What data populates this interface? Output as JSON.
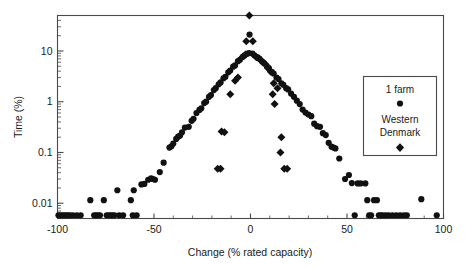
{
  "figure": {
    "background": "#ffffff",
    "frame_color": "#4a4a4a",
    "marker_color": "#111111"
  },
  "chart_data": {
    "type": "scatter",
    "title": "",
    "xlabel": "Change (% rated capacity)",
    "ylabel": "Time (%)",
    "xlim": [
      -100,
      100
    ],
    "ylim": [
      0.005,
      50
    ],
    "yscale": "log",
    "xscale": "linear",
    "grid": false,
    "legend_position": "right",
    "xticks": [
      -100,
      -50,
      0,
      50,
      100
    ],
    "xticklabels": [
      "-100",
      "-50",
      "0",
      "50",
      "100"
    ],
    "yticks": [
      10,
      1,
      0.1,
      0.01
    ],
    "yticklabels": [
      "10",
      "1",
      "0.1",
      "0.01"
    ],
    "series": [
      {
        "name": "1 farm",
        "marker": "circle",
        "color": "#111111",
        "points": [
          [
            -99.5,
            0.0058
          ],
          [
            -98.5,
            0.0058
          ],
          [
            -97.5,
            0.0058
          ],
          [
            -96.5,
            0.0058
          ],
          [
            -95.5,
            0.0058
          ],
          [
            -94.5,
            0.0058
          ],
          [
            -93.5,
            0.0058
          ],
          [
            -92.0,
            0.0058
          ],
          [
            -90.0,
            0.0058
          ],
          [
            -88.0,
            0.0058
          ],
          [
            -83.0,
            0.0115
          ],
          [
            -81.0,
            0.0058
          ],
          [
            -80.0,
            0.0058
          ],
          [
            -79.0,
            0.0058
          ],
          [
            -78.0,
            0.0058
          ],
          [
            -76.0,
            0.0115
          ],
          [
            -74.5,
            0.0058
          ],
          [
            -73.5,
            0.0058
          ],
          [
            -72.5,
            0.0058
          ],
          [
            -71.5,
            0.0058
          ],
          [
            -70.5,
            0.0058
          ],
          [
            -69.0,
            0.018
          ],
          [
            -68.0,
            0.0058
          ],
          [
            -66.0,
            0.0058
          ],
          [
            -62.0,
            0.0115
          ],
          [
            -61.0,
            0.0058
          ],
          [
            -60.5,
            0.018
          ],
          [
            -59.0,
            0.0058
          ],
          [
            -56.5,
            0.0235
          ],
          [
            -55.0,
            0.024
          ],
          [
            -53.0,
            0.029
          ],
          [
            -51.5,
            0.031
          ],
          [
            -50.5,
            0.03
          ],
          [
            -49.5,
            0.029
          ],
          [
            -47.0,
            0.041
          ],
          [
            -45.0,
            0.063
          ],
          [
            -42.0,
            0.125
          ],
          [
            -41.0,
            0.132
          ],
          [
            -40.0,
            0.15
          ],
          [
            -38.5,
            0.185
          ],
          [
            -37.5,
            0.205
          ],
          [
            -36.5,
            0.215
          ],
          [
            -35.5,
            0.25
          ],
          [
            -34.0,
            0.31
          ],
          [
            -32.0,
            0.32
          ],
          [
            -30.5,
            0.42
          ],
          [
            -29.5,
            0.46
          ],
          [
            -28.0,
            0.6
          ],
          [
            -26.5,
            0.69
          ],
          [
            -25.5,
            0.74
          ],
          [
            -24.0,
            0.94
          ],
          [
            -23.0,
            1.0
          ],
          [
            -21.5,
            1.25
          ],
          [
            -20.5,
            1.35
          ],
          [
            -19.0,
            1.7
          ],
          [
            -18.0,
            1.85
          ],
          [
            -16.5,
            2.2
          ],
          [
            -15.5,
            2.4
          ],
          [
            -14.0,
            2.9
          ],
          [
            -13.0,
            3.1
          ],
          [
            -11.5,
            3.8
          ],
          [
            -10.5,
            4.1
          ],
          [
            -9.0,
            4.9
          ],
          [
            -8.0,
            5.2
          ],
          [
            -6.5,
            6.3
          ],
          [
            -5.5,
            6.7
          ],
          [
            -4.0,
            7.7
          ],
          [
            -3.0,
            8.2
          ],
          [
            -1.8,
            8.8
          ],
          [
            -0.8,
            9.1
          ],
          [
            -0.5,
            21.0
          ],
          [
            1.0,
            8.9
          ],
          [
            2.0,
            8.2
          ],
          [
            3.5,
            7.6
          ],
          [
            4.5,
            7.1
          ],
          [
            6.0,
            6.2
          ],
          [
            7.0,
            5.7
          ],
          [
            8.5,
            5.0
          ],
          [
            9.5,
            4.6
          ],
          [
            11.0,
            3.9
          ],
          [
            12.0,
            3.6
          ],
          [
            13.5,
            3.0
          ],
          [
            14.5,
            2.8
          ],
          [
            16.0,
            2.3
          ],
          [
            17.0,
            2.15
          ],
          [
            18.5,
            1.85
          ],
          [
            19.5,
            1.75
          ],
          [
            21.0,
            1.45
          ],
          [
            22.5,
            1.25
          ],
          [
            24.0,
            1.05
          ],
          [
            25.5,
            0.9
          ],
          [
            27.0,
            0.7
          ],
          [
            28.5,
            0.61
          ],
          [
            30.0,
            0.56
          ],
          [
            31.5,
            0.52
          ],
          [
            33.0,
            0.37
          ],
          [
            34.5,
            0.33
          ],
          [
            36.0,
            0.32
          ],
          [
            37.5,
            0.24
          ],
          [
            39.0,
            0.22
          ],
          [
            40.5,
            0.155
          ],
          [
            42.0,
            0.13
          ],
          [
            43.0,
            0.125
          ],
          [
            44.0,
            0.12
          ],
          [
            46.0,
            0.076
          ],
          [
            49.0,
            0.03
          ],
          [
            51.0,
            0.036
          ],
          [
            52.5,
            0.025
          ],
          [
            54.0,
            0.0058
          ],
          [
            55.5,
            0.0245
          ],
          [
            57.0,
            0.0245
          ],
          [
            59.5,
            0.0245
          ],
          [
            60.5,
            0.0115
          ],
          [
            61.5,
            0.0058
          ],
          [
            62.5,
            0.0058
          ],
          [
            64.0,
            0.0115
          ],
          [
            65.5,
            0.0115
          ],
          [
            66.5,
            0.0058
          ],
          [
            67.5,
            0.0058
          ],
          [
            68.5,
            0.0058
          ],
          [
            70.0,
            0.0058
          ],
          [
            71.5,
            0.0058
          ],
          [
            73.5,
            0.0058
          ],
          [
            75.5,
            0.0058
          ],
          [
            77.5,
            0.0058
          ],
          [
            79.5,
            0.0058
          ],
          [
            81.0,
            0.0058
          ],
          [
            88.5,
            0.012
          ],
          [
            96.5,
            0.0058
          ]
        ]
      },
      {
        "name": "Western Denmark",
        "marker": "diamond",
        "color": "#111111",
        "points": [
          [
            -0.6,
            50.0
          ],
          [
            -2.2,
            15.5
          ],
          [
            1.2,
            15.5
          ],
          [
            -4.0,
            7.7
          ],
          [
            -2.5,
            8.5
          ],
          [
            3.0,
            7.5
          ],
          [
            4.5,
            7.0
          ],
          [
            5.5,
            6.6
          ],
          [
            -6.5,
            3.0
          ],
          [
            -8.0,
            2.6
          ],
          [
            7.5,
            5.6
          ],
          [
            9.0,
            4.6
          ],
          [
            10.5,
            3.9
          ],
          [
            -10.5,
            1.4
          ],
          [
            12.0,
            2.3
          ],
          [
            14.0,
            1.85
          ],
          [
            -15.0,
            0.26
          ],
          [
            -13.5,
            0.25
          ],
          [
            11.5,
            1.4
          ],
          [
            12.5,
            0.9
          ],
          [
            -17.0,
            0.048
          ],
          [
            -15.5,
            0.048
          ],
          [
            16.0,
            0.2
          ],
          [
            15.5,
            0.1
          ],
          [
            17.5,
            0.048
          ],
          [
            19.0,
            0.048
          ]
        ]
      }
    ]
  },
  "legend": {
    "entries": [
      {
        "label": "1 farm",
        "marker": "circle"
      },
      {
        "label": "Western",
        "label2": "Denmark",
        "marker": "diamond"
      }
    ],
    "line1": "1 farm",
    "line2": "Western",
    "line3": "Denmark"
  }
}
